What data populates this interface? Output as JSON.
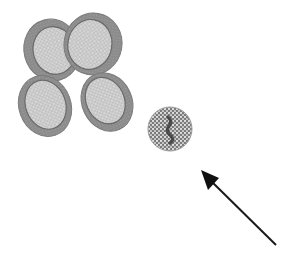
{
  "diagram": {
    "colors": {
      "background": "#ffffff",
      "cell_rim": "#8a8a8a",
      "cell_rim_dark": "#6e6e6e",
      "cell_center": "#c4c4c4",
      "cell_dots": "#e4e4e4",
      "spherocyte_fill": "#8c8c8c",
      "spherocyte_dots": "#e0e0e0",
      "spherocyte_core": "#3c3c3c",
      "arrow": "#1a1a1a"
    },
    "cells": [
      {
        "id": "rbc-upper-left",
        "cx": 52,
        "cy": 50,
        "rx": 28,
        "ry": 31,
        "rotate": -15
      },
      {
        "id": "rbc-upper-right",
        "cx": 93,
        "cy": 44,
        "rx": 29,
        "ry": 31,
        "rotate": 10
      },
      {
        "id": "rbc-lower-left",
        "cx": 45,
        "cy": 106,
        "rx": 26,
        "ry": 31,
        "rotate": -20
      },
      {
        "id": "rbc-lower-right",
        "cx": 107,
        "cy": 102,
        "rx": 25,
        "ry": 30,
        "rotate": -25
      }
    ],
    "spherocyte": {
      "cx": 170,
      "cy": 129,
      "r": 22
    },
    "arrow": {
      "x1": 276,
      "y1": 245,
      "x2": 202,
      "y2": 172
    }
  }
}
